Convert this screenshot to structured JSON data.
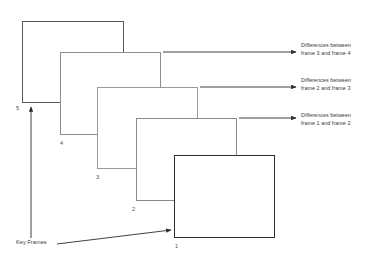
{
  "diagram": {
    "background_color": "#ffffff",
    "frames": [
      {
        "id": "frame-5",
        "label": "5",
        "x": 22,
        "y": 21,
        "w": 102,
        "h": 82,
        "border_color": "#5a5a5a",
        "border_width": 1.1,
        "label_x": 16,
        "label_y": 106
      },
      {
        "id": "frame-4",
        "label": "4",
        "x": 60,
        "y": 52,
        "w": 101,
        "h": 83,
        "border_color": "#8d8d8d",
        "border_width": 1.0,
        "label_x": 60,
        "label_y": 141
      },
      {
        "id": "frame-3",
        "label": "3",
        "x": 97,
        "y": 87,
        "w": 101,
        "h": 82,
        "border_color": "#9a9a9a",
        "border_width": 1.0,
        "label_x": 96,
        "label_y": 175
      },
      {
        "id": "frame-2",
        "label": "2",
        "x": 136,
        "y": 118,
        "w": 101,
        "h": 83,
        "border_color": "#8a8a8a",
        "border_width": 1.0,
        "label_x": 132,
        "label_y": 207
      },
      {
        "id": "frame-1",
        "label": "1",
        "x": 174,
        "y": 155,
        "w": 101,
        "h": 83,
        "border_color": "#2e2e2e",
        "border_width": 1.3,
        "label_x": 175,
        "label_y": 244
      }
    ],
    "difference_labels": [
      {
        "id": "diff-3-4",
        "line1": "Differences between",
        "line2": "frame 3 and frame 4",
        "text_x": 301,
        "text_y": 41,
        "arrow_x1": 163,
        "arrow_y1": 52,
        "arrow_x2": 296,
        "arrow_y2": 52
      },
      {
        "id": "diff-2-3",
        "line1": "Differences between",
        "line2": "frame 2 and frame 3",
        "text_x": 301,
        "text_y": 76,
        "arrow_x1": 200,
        "arrow_y1": 87,
        "arrow_x2": 296,
        "arrow_y2": 87
      },
      {
        "id": "diff-1-2",
        "line1": "Differences between",
        "line2": "frame 1 and frame 2",
        "text_x": 301,
        "text_y": 111,
        "arrow_x1": 239,
        "arrow_y1": 118,
        "arrow_x2": 296,
        "arrow_y2": 118
      }
    ],
    "key_frames": {
      "label": "Key Frames",
      "text_x": 16,
      "text_y": 240,
      "arrow_x1": 57,
      "arrow_y1": 244,
      "arrow_x2": 171,
      "arrow_y2": 230
    },
    "time_axis": {
      "id": "vertical-time-arrow",
      "x1": 31,
      "y1": 238,
      "x2": 31,
      "y2": 107
    },
    "line_color": "#2b2b2b"
  }
}
